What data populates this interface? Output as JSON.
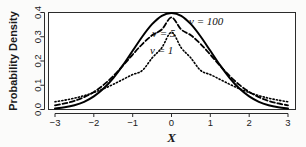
{
  "chart_data": {
    "type": "line",
    "title": "",
    "xlabel": "X",
    "ylabel": "Probability Density",
    "xlim": [
      -3,
      3
    ],
    "ylim": [
      0,
      0.4
    ],
    "grid": false,
    "legend_position": "inside-upper-right",
    "x_ticks": [
      "-3",
      "-2",
      "-1",
      "0",
      "1",
      "2",
      "3"
    ],
    "x_tick_values": [
      -3,
      -2,
      -1,
      0,
      1,
      2,
      3
    ],
    "y_ticks": [
      "0.0",
      "0.1",
      "0.2",
      "0.3",
      "0.4"
    ],
    "y_tick_values": [
      0.0,
      0.1,
      0.2,
      0.3,
      0.4
    ],
    "x": [
      -3.0,
      -2.75,
      -2.5,
      -2.25,
      -2.0,
      -1.75,
      -1.5,
      -1.25,
      -1.0,
      -0.75,
      -0.5,
      -0.25,
      0.0,
      0.25,
      0.5,
      0.75,
      1.0,
      1.25,
      1.5,
      1.75,
      2.0,
      2.25,
      2.5,
      2.75,
      3.0
    ],
    "series": [
      {
        "name": "v = 100",
        "label": "ν = 100",
        "symbol": "ν",
        "value": "100",
        "style": "solid",
        "color": "#000000",
        "width": 2.0,
        "peak": 0.3976,
        "values": [
          0.0043,
          0.009,
          0.0174,
          0.0316,
          0.0538,
          0.0862,
          0.1295,
          0.1827,
          0.2421,
          0.3011,
          0.3518,
          0.3865,
          0.3976,
          0.3865,
          0.3518,
          0.3011,
          0.2421,
          0.1827,
          0.1295,
          0.0862,
          0.0538,
          0.0316,
          0.0174,
          0.009,
          0.0043
        ]
      },
      {
        "name": "v = 5",
        "label": "ν = 5",
        "symbol": "ν",
        "value": "5",
        "style": "dashed",
        "color": "#000000",
        "width": 1.8,
        "peak": 0.3796,
        "values": [
          0.0173,
          0.0248,
          0.0356,
          0.051,
          0.0725,
          0.1014,
          0.1379,
          0.1807,
          0.2264,
          0.27,
          0.306,
          0.33,
          0.3796,
          0.33,
          0.306,
          0.27,
          0.2264,
          0.1807,
          0.1379,
          0.1014,
          0.0725,
          0.051,
          0.0356,
          0.0248,
          0.0173
        ]
      },
      {
        "name": "v = 1",
        "label": "ν = 1",
        "symbol": "ν",
        "value": "1",
        "style": "dotted",
        "color": "#000000",
        "width": 1.6,
        "peak": 0.3183,
        "values": [
          0.0318,
          0.0385,
          0.0468,
          0.0572,
          0.07,
          0.0855,
          0.1038,
          0.124,
          0.144,
          0.161,
          0.2122,
          0.2546,
          0.3183,
          0.2546,
          0.2122,
          0.161,
          0.144,
          0.124,
          0.1038,
          0.0855,
          0.07,
          0.0572,
          0.0468,
          0.0385,
          0.0318
        ]
      }
    ]
  },
  "labels": {
    "y_axis_title": "Probability Density",
    "x_axis_title": "X",
    "series_100": "ν = 100",
    "series_5": "ν = 5",
    "series_1": "ν = 1",
    "y0": "0.0",
    "y1": "0.1",
    "y2": "0.2",
    "y3": "0.3",
    "y4": "0.4",
    "x0": "−3",
    "x1": "−2",
    "x2": "−1",
    "x3": "0",
    "x4": "1",
    "x5": "2",
    "x6": "3"
  }
}
